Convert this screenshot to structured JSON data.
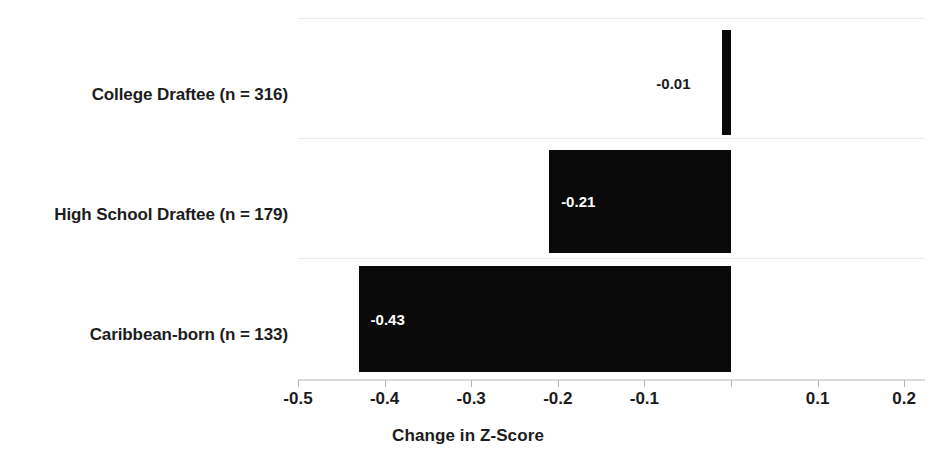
{
  "chart_data": {
    "type": "bar",
    "orientation": "horizontal",
    "title": "",
    "xlabel": "Change in Z-Score",
    "ylabel": "",
    "categories": [
      "College Draftee (n = 316)",
      "High School Draftee (n = 179)",
      "Caribbean-born (n = 133)"
    ],
    "values": [
      -0.01,
      -0.21,
      -0.43
    ],
    "value_labels": [
      "-0.01",
      "-0.21",
      "-0.43"
    ],
    "xlim": [
      -0.5,
      0.2
    ],
    "xticks": [
      -0.5,
      -0.4,
      -0.3,
      -0.2,
      -0.1,
      0.1,
      0.2
    ],
    "xtick_labels": [
      "-0.5",
      "-0.4",
      "-0.3",
      "-0.2",
      "-0.1",
      "0.1",
      "0.2"
    ],
    "grid": true,
    "legend": false,
    "bar_color": "#0a0a0a",
    "inside_label_color": "#ffffff",
    "outside_label_color": "#1c1c1c",
    "gridline_color": "#eceaea",
    "background_color": "#ffffff"
  }
}
